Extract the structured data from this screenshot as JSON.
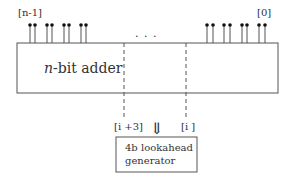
{
  "adder": {
    "label_var": "n",
    "label_rest": "-bit adder",
    "msb_label": "[n-1]",
    "lsb_label": "[0]",
    "ellipsis": ". . .",
    "left_pins": 8,
    "right_pins": 8
  },
  "group": {
    "upper_label": "[i +3]",
    "lower_label": "[i ]"
  },
  "arrow": {
    "glyph": "⇓"
  },
  "lookahead": {
    "line1": "4b lookahead",
    "line2": "generator"
  },
  "colors": {
    "stroke": "#555555",
    "pin": "#111111",
    "text": "#333333"
  }
}
